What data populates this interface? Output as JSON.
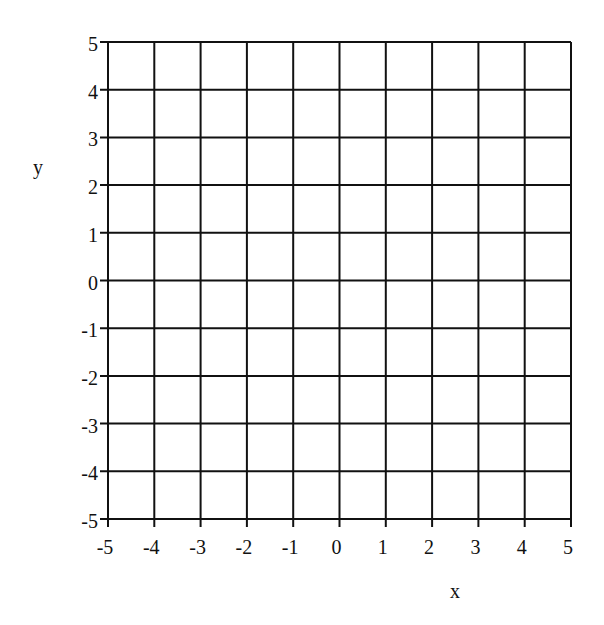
{
  "chart_data": {
    "type": "scatter",
    "title": "",
    "xlabel": "x",
    "ylabel": "y",
    "xlim": [
      -5,
      5
    ],
    "ylim": [
      -5,
      5
    ],
    "grid": true,
    "x_ticks": [
      -5,
      -4,
      -3,
      -2,
      -1,
      0,
      1,
      2,
      3,
      4,
      5
    ],
    "y_ticks": [
      -5,
      -4,
      -3,
      -2,
      -1,
      0,
      1,
      2,
      3,
      4,
      5
    ],
    "x_tick_labels": [
      "-5",
      "-4",
      "-3",
      "-2",
      "-1",
      "0",
      "1",
      "2",
      "3",
      "4",
      "5"
    ],
    "y_tick_labels": [
      "-5",
      "-4",
      "-3",
      "-2",
      "-1",
      "0",
      "1",
      "2",
      "3",
      "4",
      "5"
    ],
    "series": [],
    "legend": null
  },
  "colors": {
    "grid_line": "#111111",
    "text": "#111111",
    "background": "#ffffff"
  }
}
